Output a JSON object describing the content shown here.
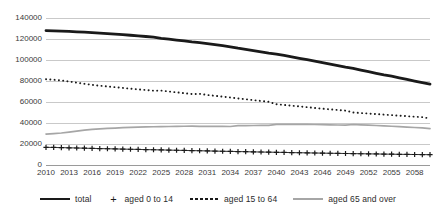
{
  "chart_data": {
    "type": "line",
    "title": "",
    "subtitle": "",
    "xlabel": "",
    "ylabel": "",
    "xlim": [
      2010,
      2060
    ],
    "ylim": [
      0,
      140000
    ],
    "y_ticks": [
      0,
      20000,
      40000,
      60000,
      80000,
      100000,
      120000,
      140000
    ],
    "y_tick_labels": [
      "0",
      "20000",
      "40000",
      "60000",
      "80000",
      "100000",
      "120000",
      "140000"
    ],
    "x_ticks": [
      2010,
      2013,
      2016,
      2019,
      2022,
      2025,
      2028,
      2031,
      2034,
      2037,
      2040,
      2043,
      2046,
      2049,
      2052,
      2055,
      2058
    ],
    "x_tick_labels": [
      "2010",
      "2013",
      "2016",
      "2019",
      "2022",
      "2025",
      "2028",
      "2031",
      "2034",
      "2037",
      "2040",
      "2043",
      "2046",
      "2049",
      "2052",
      "2055",
      "2058"
    ],
    "grid": true,
    "legend_position": "bottom",
    "x": [
      2010,
      2011,
      2012,
      2013,
      2014,
      2015,
      2016,
      2017,
      2018,
      2019,
      2020,
      2021,
      2022,
      2023,
      2024,
      2025,
      2026,
      2027,
      2028,
      2029,
      2030,
      2031,
      2032,
      2033,
      2034,
      2035,
      2036,
      2037,
      2038,
      2039,
      2040,
      2041,
      2042,
      2043,
      2044,
      2045,
      2046,
      2047,
      2048,
      2049,
      2050,
      2051,
      2052,
      2053,
      2054,
      2055,
      2056,
      2057,
      2058,
      2059,
      2060
    ],
    "series": [
      {
        "name": "total",
        "style": "solid-thick",
        "color": "#1a1a1a",
        "values": [
          128057,
          127799,
          127515,
          127200,
          126851,
          126466,
          126049,
          125599,
          125114,
          124594,
          124100,
          123557,
          122977,
          122365,
          121726,
          120659,
          119861,
          119032,
          118175,
          117288,
          116618,
          115638,
          114629,
          113591,
          112524,
          111212,
          110097,
          108957,
          107790,
          106597,
          105695,
          104360,
          103009,
          101645,
          100267,
          99000,
          97480,
          96045,
          94602,
          93150,
          91933,
          90330,
          88830,
          87329,
          85827,
          84592,
          83040,
          81504,
          79983,
          78479,
          76991
        ]
      },
      {
        "name": "aged 0 to 14",
        "style": "plus-markers",
        "color": "#1a1a1a",
        "values": [
          16839,
          16700,
          16547,
          16380,
          16200,
          16000,
          15827,
          15650,
          15480,
          15320,
          15152,
          14990,
          14830,
          14670,
          14510,
          14350,
          14190,
          14030,
          13870,
          13710,
          13560,
          13400,
          13250,
          13100,
          12950,
          12800,
          12650,
          12500,
          12360,
          12220,
          12100,
          11950,
          11810,
          11680,
          11550,
          11420,
          11300,
          11180,
          11060,
          10940,
          10840,
          10720,
          10610,
          10500,
          10390,
          10290,
          10190,
          10090,
          10000,
          9910,
          9820
        ]
      },
      {
        "name": "aged 15 to 64",
        "style": "dotted",
        "color": "#1a1a1a",
        "values": [
          81735,
          81200,
          80500,
          79500,
          78400,
          77300,
          76300,
          75500,
          74800,
          74100,
          73408,
          72700,
          72000,
          71400,
          70800,
          70845,
          70000,
          69200,
          68400,
          67600,
          67730,
          66700,
          65900,
          65100,
          64300,
          63430,
          62600,
          61800,
          61000,
          60200,
          57866,
          57200,
          56500,
          55800,
          55100,
          54300,
          53600,
          53000,
          52400,
          51800,
          50013,
          49500,
          49000,
          48500,
          48000,
          47500,
          47000,
          46500,
          46000,
          45600,
          44180
        ]
      },
      {
        "name": "aged 65 and over",
        "style": "solid-grey",
        "color": "#a6a6a6",
        "values": [
          29484,
          29900,
          30470,
          31320,
          32250,
          33170,
          33920,
          34450,
          34840,
          35180,
          35540,
          35870,
          36150,
          36300,
          36420,
          36573,
          36670,
          36800,
          36900,
          36980,
          36849,
          36800,
          36760,
          36720,
          36680,
          37407,
          37500,
          37600,
          37700,
          37790,
          38678,
          38700,
          38720,
          38740,
          38760,
          38564,
          38400,
          38250,
          38100,
          37950,
          38564,
          38200,
          37900,
          37600,
          37300,
          36900,
          36500,
          36100,
          35700,
          35300,
          34640
        ]
      }
    ]
  },
  "legend": {
    "items": [
      {
        "label": "total",
        "key": "solid-thick-line-key"
      },
      {
        "label": "aged 0 to 14",
        "key": "plus-marker-key"
      },
      {
        "label": "aged 15 to 64",
        "key": "dotted-line-key"
      },
      {
        "label": "aged 65 and over",
        "key": "grey-line-key"
      }
    ]
  }
}
